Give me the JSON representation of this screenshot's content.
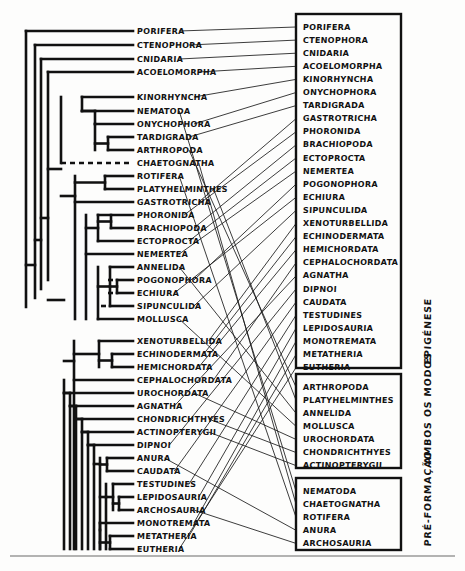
{
  "figure": {
    "type": "cladogram-with-character-state-boxes",
    "language": "pt-BR",
    "background_color": "#fdfdfc",
    "ink_color": "#111111"
  },
  "cladogram": {
    "name": "metazoan-phylogeny",
    "taxa": [
      {
        "index": 0,
        "label": "PORIFERA",
        "y": 31
      },
      {
        "index": 1,
        "label": "CTENOPHORA",
        "y": 45
      },
      {
        "index": 2,
        "label": "CNIDARIA",
        "y": 59
      },
      {
        "index": 3,
        "label": "ACOELOMORPHA",
        "y": 72
      },
      {
        "index": 4,
        "label": "KINORHYNCHA",
        "y": 97
      },
      {
        "index": 5,
        "label": "NEMATODA",
        "y": 111
      },
      {
        "index": 6,
        "label": "ONYCHOPHORA",
        "y": 124
      },
      {
        "index": 7,
        "label": "TARDIGRADA",
        "y": 137
      },
      {
        "index": 8,
        "label": "ARTHROPODA",
        "y": 150
      },
      {
        "index": 9,
        "label": "CHAETOGNATHA",
        "y": 163
      },
      {
        "index": 10,
        "label": "ROTIFERA",
        "y": 176
      },
      {
        "index": 11,
        "label": "PLATYHELMINTHES",
        "y": 189
      },
      {
        "index": 12,
        "label": "GASTROTRICHA",
        "y": 202
      },
      {
        "index": 13,
        "label": "PHORONIDA",
        "y": 215
      },
      {
        "index": 14,
        "label": "BRACHIOPODA",
        "y": 228
      },
      {
        "index": 15,
        "label": "ECTOPROCTA",
        "y": 241
      },
      {
        "index": 16,
        "label": "NEMERTEA",
        "y": 254
      },
      {
        "index": 17,
        "label": "ANNELIDA",
        "y": 267
      },
      {
        "index": 18,
        "label": "POGONOPHORA",
        "y": 280
      },
      {
        "index": 19,
        "label": "ECHIURA",
        "y": 293
      },
      {
        "index": 20,
        "label": "SIPUNCULIDA",
        "y": 306
      },
      {
        "index": 21,
        "label": "MOLLUSCA",
        "y": 319
      },
      {
        "index": 22,
        "label": "XENOTURBELLIDA",
        "y": 341
      },
      {
        "index": 23,
        "label": "ECHINODERMATA",
        "y": 354
      },
      {
        "index": 24,
        "label": "HEMICHORDATA",
        "y": 367
      },
      {
        "index": 25,
        "label": "CEPHALOCHORDATA",
        "y": 380
      },
      {
        "index": 26,
        "label": "UROCHORDATA",
        "y": 393
      },
      {
        "index": 27,
        "label": "AGNATHA",
        "y": 406
      },
      {
        "index": 28,
        "label": "CHONDRICHTHYES",
        "y": 419
      },
      {
        "index": 29,
        "label": "ACTINOPTERYGII",
        "y": 432
      },
      {
        "index": 30,
        "label": "DIPNOI",
        "y": 445
      },
      {
        "index": 31,
        "label": "ANURA",
        "y": 458
      },
      {
        "index": 32,
        "label": "CAUDATA",
        "y": 471
      },
      {
        "index": 33,
        "label": "TESTUDINES",
        "y": 484
      },
      {
        "index": 34,
        "label": "LEPIDOSAURIA",
        "y": 497
      },
      {
        "index": 35,
        "label": "ARCHOSAURIA",
        "y": 510
      },
      {
        "index": 36,
        "label": "MONOTREMATA",
        "y": 523
      },
      {
        "index": 37,
        "label": "METATHERIA",
        "y": 536
      },
      {
        "index": 38,
        "label": "EUTHERIA",
        "y": 549
      }
    ]
  },
  "boxes": [
    {
      "id": "box-epigenese",
      "side_label": "EPIGÉNESE",
      "x": 296,
      "y": 14,
      "w": 105,
      "h": 354,
      "items": [
        "PORIFERA",
        "CTENOPHORA",
        "CNIDARIA",
        "ACOELOMORPHA",
        "KINORHYNCHA",
        "ONYCHOPHORA",
        "TARDIGRADA",
        "GASTROTRICHA",
        "PHORONIDA",
        "BRACHIOPODA",
        "ECTOPROCTA",
        "NEMERTEA",
        "POGONOPHORA",
        "ECHIURA",
        "SIPUNCULIDA",
        "XENOTURBELLIDA",
        "ECHINODERMATA",
        "HEMICHORDATA",
        "CEPHALOCHORDATA",
        "AGNATHA",
        "DIPNOI",
        "CAUDATA",
        "TESTUDINES",
        "LEPIDOSAURIA",
        "MONOTREMATA",
        "METATHERIA",
        "EUTHERIA"
      ]
    },
    {
      "id": "box-ambos-os-modos",
      "side_label": "AMBOS OS MODOS",
      "x": 296,
      "y": 374,
      "w": 105,
      "h": 94,
      "items": [
        "ARTHROPODA",
        "PLATYHELMINTHES",
        "ANNELIDA",
        "MOLLUSCA",
        "UROCHORDATA",
        "CHONDRICHTHYES",
        "ACTINOPTERYGII"
      ]
    },
    {
      "id": "box-pre-formacao",
      "side_label": "PRÉ-FORMAÇÃO",
      "x": 296,
      "y": 478,
      "w": 105,
      "h": 72,
      "items": [
        "NEMATODA",
        "CHAETOGNATHA",
        "ROTIFERA",
        "ANURA",
        "ARCHOSAURIA"
      ]
    }
  ],
  "connections": [
    {
      "from": "PORIFERA",
      "to_box": "box-epigenese",
      "to_index": 0
    },
    {
      "from": "CTENOPHORA",
      "to_box": "box-epigenese",
      "to_index": 1
    },
    {
      "from": "CNIDARIA",
      "to_box": "box-epigenese",
      "to_index": 2
    },
    {
      "from": "ACOELOMORPHA",
      "to_box": "box-epigenese",
      "to_index": 3
    },
    {
      "from": "KINORHYNCHA",
      "to_box": "box-epigenese",
      "to_index": 4
    },
    {
      "from": "ONYCHOPHORA",
      "to_box": "box-epigenese",
      "to_index": 5
    },
    {
      "from": "TARDIGRADA",
      "to_box": "box-epigenese",
      "to_index": 6
    },
    {
      "from": "GASTROTRICHA",
      "to_box": "box-epigenese",
      "to_index": 7
    },
    {
      "from": "PHORONIDA",
      "to_box": "box-epigenese",
      "to_index": 8
    },
    {
      "from": "BRACHIOPODA",
      "to_box": "box-epigenese",
      "to_index": 9
    },
    {
      "from": "ECTOPROCTA",
      "to_box": "box-epigenese",
      "to_index": 10
    },
    {
      "from": "NEMERTEA",
      "to_box": "box-epigenese",
      "to_index": 11
    },
    {
      "from": "POGONOPHORA",
      "to_box": "box-epigenese",
      "to_index": 12
    },
    {
      "from": "ECHIURA",
      "to_box": "box-epigenese",
      "to_index": 13
    },
    {
      "from": "SIPUNCULIDA",
      "to_box": "box-epigenese",
      "to_index": 14
    },
    {
      "from": "XENOTURBELLIDA",
      "to_box": "box-epigenese",
      "to_index": 15
    },
    {
      "from": "ECHINODERMATA",
      "to_box": "box-epigenese",
      "to_index": 16
    },
    {
      "from": "HEMICHORDATA",
      "to_box": "box-epigenese",
      "to_index": 17
    },
    {
      "from": "CEPHALOCHORDATA",
      "to_box": "box-epigenese",
      "to_index": 18
    },
    {
      "from": "AGNATHA",
      "to_box": "box-epigenese",
      "to_index": 19
    },
    {
      "from": "DIPNOI",
      "to_box": "box-epigenese",
      "to_index": 20
    },
    {
      "from": "CAUDATA",
      "to_box": "box-epigenese",
      "to_index": 21
    },
    {
      "from": "TESTUDINES",
      "to_box": "box-epigenese",
      "to_index": 22
    },
    {
      "from": "LEPIDOSAURIA",
      "to_box": "box-epigenese",
      "to_index": 23
    },
    {
      "from": "MONOTREMATA",
      "to_box": "box-epigenese",
      "to_index": 24
    },
    {
      "from": "METATHERIA",
      "to_box": "box-epigenese",
      "to_index": 25
    },
    {
      "from": "EUTHERIA",
      "to_box": "box-epigenese",
      "to_index": 26
    },
    {
      "from": "ARTHROPODA",
      "to_box": "box-ambos-os-modos",
      "to_index": 0
    },
    {
      "from": "PLATYHELMINTHES",
      "to_box": "box-ambos-os-modos",
      "to_index": 1
    },
    {
      "from": "ANNELIDA",
      "to_box": "box-ambos-os-modos",
      "to_index": 2
    },
    {
      "from": "MOLLUSCA",
      "to_box": "box-ambos-os-modos",
      "to_index": 3
    },
    {
      "from": "UROCHORDATA",
      "to_box": "box-ambos-os-modos",
      "to_index": 4
    },
    {
      "from": "CHONDRICHTHYES",
      "to_box": "box-ambos-os-modos",
      "to_index": 5
    },
    {
      "from": "ACTINOPTERYGII",
      "to_box": "box-ambos-os-modos",
      "to_index": 6
    },
    {
      "from": "NEMATODA",
      "to_box": "box-pre-formacao",
      "to_index": 0
    },
    {
      "from": "CHAETOGNATHA",
      "to_box": "box-pre-formacao",
      "to_index": 1
    },
    {
      "from": "ROTIFERA",
      "to_box": "box-pre-formacao",
      "to_index": 2
    },
    {
      "from": "ANURA",
      "to_box": "box-pre-formacao",
      "to_index": 3
    },
    {
      "from": "ARCHOSAURIA",
      "to_box": "box-pre-formacao",
      "to_index": 4
    }
  ],
  "footer_rule": {
    "name": "bottom-divider",
    "y": 556
  }
}
